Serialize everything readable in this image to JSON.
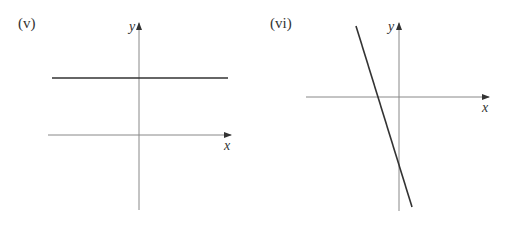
{
  "panels": [
    {
      "label": "(v)",
      "x_axis_label": "x",
      "y_axis_label": "y",
      "line_description": "horizontal line above x-axis (positive y-intercept, zero gradient)"
    },
    {
      "label": "(vi)",
      "x_axis_label": "x",
      "y_axis_label": "y",
      "line_description": "steep line with negative gradient, negative x-intercept, negative y-intercept"
    }
  ],
  "colors": {
    "axis": "#888888",
    "line": "#333333",
    "text": "#333333"
  }
}
